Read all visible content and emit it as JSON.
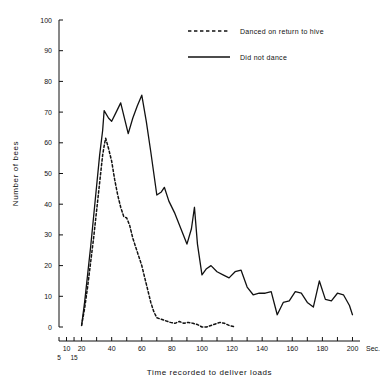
{
  "chart_data": {
    "type": "line",
    "title": "",
    "xlabel": "Time recorded to deliver loads",
    "ylabel": "Number of bees",
    "x_unit": "Sec.",
    "xlim": [
      5,
      205
    ],
    "ylim": [
      0,
      100
    ],
    "grid": false,
    "legend_position": "top-center",
    "y_ticks": [
      0,
      10,
      20,
      30,
      40,
      50,
      60,
      70,
      80,
      90,
      100
    ],
    "x_ticks": [
      5,
      10,
      15,
      20,
      40,
      60,
      80,
      100,
      120,
      140,
      160,
      180,
      200
    ],
    "x_tick_labels_upper": [
      "10",
      "20",
      "40",
      "60",
      "80",
      "100",
      "120",
      "140",
      "160",
      "180",
      "200"
    ],
    "x_tick_labels_lower": [
      "5",
      "15"
    ],
    "series": [
      {
        "name": "Danced on return to hive",
        "style": "dashed",
        "color": "#111111",
        "points": [
          [
            20,
            0.5
          ],
          [
            22,
            6
          ],
          [
            24,
            13
          ],
          [
            26,
            21
          ],
          [
            28,
            29
          ],
          [
            30,
            38
          ],
          [
            32,
            47
          ],
          [
            34,
            56
          ],
          [
            35,
            59
          ],
          [
            36,
            61.5
          ],
          [
            38,
            58
          ],
          [
            40,
            54
          ],
          [
            42,
            48
          ],
          [
            44,
            43
          ],
          [
            46,
            39
          ],
          [
            48,
            36
          ],
          [
            50,
            35.5
          ],
          [
            52,
            33
          ],
          [
            54,
            29
          ],
          [
            56,
            26
          ],
          [
            58,
            23
          ],
          [
            60,
            20
          ],
          [
            62,
            16
          ],
          [
            64,
            12
          ],
          [
            66,
            8
          ],
          [
            68,
            5
          ],
          [
            70,
            3
          ],
          [
            73,
            2.5
          ],
          [
            76,
            2
          ],
          [
            79,
            1.5
          ],
          [
            82,
            1.2
          ],
          [
            85,
            1.8
          ],
          [
            88,
            1.2
          ],
          [
            91,
            1.5
          ],
          [
            94,
            1.2
          ],
          [
            97,
            0.8
          ],
          [
            100,
            0
          ],
          [
            103,
            0
          ],
          [
            106,
            0.5
          ],
          [
            109,
            1
          ],
          [
            112,
            1.5
          ],
          [
            115,
            1.2
          ],
          [
            118,
            0.5
          ],
          [
            122,
            0
          ]
        ]
      },
      {
        "name": "Did not dance",
        "style": "solid",
        "color": "#111111",
        "points": [
          [
            20,
            0.5
          ],
          [
            22,
            8
          ],
          [
            24,
            17
          ],
          [
            26,
            26
          ],
          [
            28,
            36
          ],
          [
            30,
            46
          ],
          [
            32,
            56
          ],
          [
            34,
            64
          ],
          [
            35,
            70.5
          ],
          [
            38,
            68
          ],
          [
            40,
            67
          ],
          [
            43,
            70
          ],
          [
            46,
            73
          ],
          [
            49,
            67
          ],
          [
            51,
            63
          ],
          [
            54,
            68
          ],
          [
            57,
            72
          ],
          [
            60,
            75.5
          ],
          [
            63,
            67
          ],
          [
            66,
            57
          ],
          [
            70,
            43
          ],
          [
            73,
            44
          ],
          [
            75,
            45.5
          ],
          [
            78,
            41
          ],
          [
            82,
            37
          ],
          [
            86,
            32
          ],
          [
            90,
            27
          ],
          [
            93,
            32
          ],
          [
            95,
            39
          ],
          [
            97,
            27
          ],
          [
            100,
            17
          ],
          [
            103,
            19
          ],
          [
            106,
            20
          ],
          [
            110,
            18
          ],
          [
            114,
            17
          ],
          [
            118,
            16
          ],
          [
            122,
            18
          ],
          [
            126,
            18.5
          ],
          [
            130,
            13
          ],
          [
            134,
            10.5
          ],
          [
            138,
            11
          ],
          [
            142,
            11
          ],
          [
            146,
            11.5
          ],
          [
            150,
            4
          ],
          [
            154,
            8
          ],
          [
            158,
            8.5
          ],
          [
            162,
            11.5
          ],
          [
            166,
            11
          ],
          [
            170,
            8
          ],
          [
            174,
            6.5
          ],
          [
            178,
            15
          ],
          [
            182,
            9
          ],
          [
            186,
            8.5
          ],
          [
            190,
            11
          ],
          [
            194,
            10.5
          ],
          [
            198,
            7
          ],
          [
            200,
            4
          ]
        ]
      }
    ]
  },
  "legend": {
    "items": [
      {
        "label": "Danced on return to hive",
        "style": "dashed"
      },
      {
        "label": "Did not dance",
        "style": "solid"
      }
    ]
  }
}
